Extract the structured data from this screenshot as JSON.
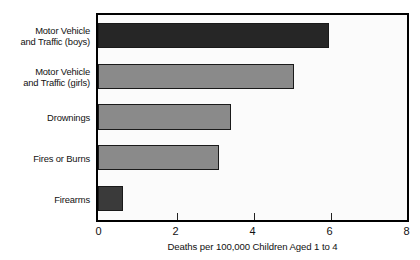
{
  "chart_data": {
    "type": "bar",
    "orientation": "horizontal",
    "title": "",
    "xlabel": "Deaths per 100,000 Children Aged 1 to 4",
    "ylabel": "",
    "xlim": [
      0,
      8
    ],
    "xticks": [
      0,
      2,
      4,
      6,
      8
    ],
    "xtick_labels": [
      "0",
      "2",
      "4",
      "6",
      "8"
    ],
    "grid": false,
    "legend": false,
    "categories": [
      "Motor Vehicle\nand Traffic (boys)",
      "Motor Vehicle\nand Traffic (girls)",
      "Drownings",
      "Fires or Burns",
      "Firearms"
    ],
    "values": [
      6.0,
      5.1,
      3.45,
      3.15,
      0.65
    ],
    "bar_colors": [
      "#262626",
      "#8a8a8a",
      "#8a8a8a",
      "#8a8a8a",
      "#3a3a3a"
    ]
  },
  "figure": {
    "background": "#ffffff",
    "plot_background": "#fbfbfb",
    "frame_color": "#000000"
  }
}
